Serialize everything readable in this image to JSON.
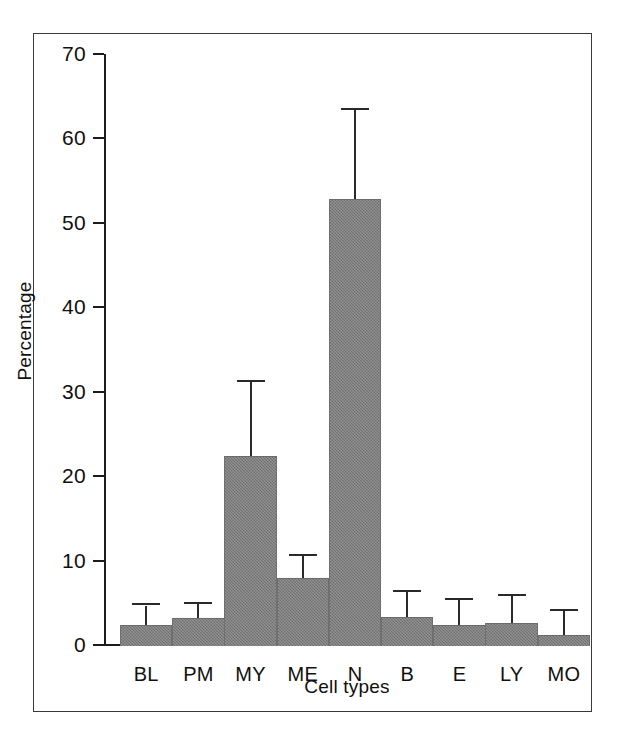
{
  "figure": {
    "background": "#ffffff",
    "frame_color": "#3a3a3a",
    "axis_color": "#1c1c1c",
    "bar_color": "#7c7c7c",
    "errorbar_color": "#2a2a2a"
  },
  "chart_data": {
    "type": "bar",
    "title": "",
    "xlabel": "Cell types",
    "ylabel": "Percentage",
    "ylim": [
      0,
      70
    ],
    "yticks": [
      0,
      10,
      20,
      30,
      40,
      50,
      60,
      70
    ],
    "grid": false,
    "legend": null,
    "categories": [
      "BL",
      "PM",
      "MY",
      "ME",
      "N",
      "B",
      "E",
      "LY",
      "MO"
    ],
    "values": [
      2.5,
      3.3,
      22.5,
      8.1,
      53.0,
      3.4,
      2.5,
      2.7,
      1.3
    ],
    "error_upper": [
      4.8,
      5.0,
      31.3,
      10.7,
      63.5,
      6.4,
      5.5,
      5.9,
      4.2
    ],
    "series": [
      {
        "name": "Percentage",
        "values": [
          2.5,
          3.3,
          22.5,
          8.1,
          53.0,
          3.4,
          2.5,
          2.7,
          1.3
        ],
        "error_upper": [
          4.8,
          5.0,
          31.3,
          10.7,
          63.5,
          6.4,
          5.5,
          5.9,
          4.2
        ]
      }
    ]
  }
}
